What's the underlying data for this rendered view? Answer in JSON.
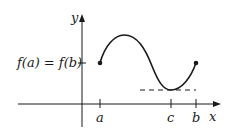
{
  "diagram": {
    "axes": {
      "x_label": "x",
      "y_label": "y"
    },
    "y_tick_label": "f(a) = f(b)",
    "x_tick_labels": {
      "a": "a",
      "c": "c",
      "b": "b"
    },
    "curve": {
      "start_point": "(a, f(a))",
      "end_point": "(b, f(b))",
      "horizontal_tangent_at": "c"
    },
    "colors": {
      "ink": "#1a1a1a",
      "background": "#ffffff"
    }
  }
}
